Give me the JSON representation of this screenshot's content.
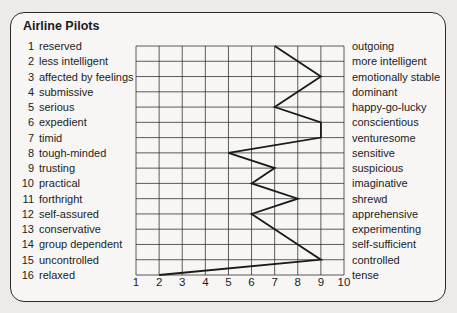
{
  "title": "Airline Pilots",
  "left_labels": [
    {
      "num": "1",
      "text": "reserved"
    },
    {
      "num": "2",
      "text": "less intelligent"
    },
    {
      "num": "3",
      "text": "affected by feelings"
    },
    {
      "num": "4",
      "text": "submissive"
    },
    {
      "num": "5",
      "text": "serious"
    },
    {
      "num": "6",
      "text": "expedient"
    },
    {
      "num": "7",
      "text": "timid"
    },
    {
      "num": "8",
      "text": "tough-minded"
    },
    {
      "num": "9",
      "text": "trusting"
    },
    {
      "num": "10",
      "text": "practical"
    },
    {
      "num": "11",
      "text": "forthright"
    },
    {
      "num": "12",
      "text": "self-assured"
    },
    {
      "num": "13",
      "text": "conservative"
    },
    {
      "num": "14",
      "text": "group dependent"
    },
    {
      "num": "15",
      "text": "uncontrolled"
    },
    {
      "num": "16",
      "text": "relaxed"
    }
  ],
  "right_labels": [
    "outgoing",
    "more intelligent",
    "emotionally stable",
    "dominant",
    "happy-go-lucky",
    "conscientious",
    "venturesome",
    "sensitive",
    "suspicious",
    "imaginative",
    "shrewd",
    "apprehensive",
    "experimenting",
    "self-sufficient",
    "controlled",
    "tense"
  ],
  "x_ticks": [
    "1",
    "2",
    "3",
    "4",
    "5",
    "6",
    "7",
    "8",
    "9",
    "10"
  ],
  "colors": {
    "line": "#1a1a1a",
    "grid": "#333333",
    "background": "#f7f6f4"
  },
  "chart_data": {
    "type": "line",
    "title": "Airline Pilots",
    "orientation": "horizontal-profile",
    "categories": [
      "1 reserved / outgoing",
      "2 less intelligent / more intelligent",
      "3 affected by feelings / emotionally stable",
      "4 submissive / dominant",
      "5 serious / happy-go-lucky",
      "6 expedient / conscientious",
      "7 timid / venturesome",
      "8 tough-minded / sensitive",
      "9 trusting / suspicious",
      "10 practical / imaginative",
      "11 forthright / shrewd",
      "12 self-assured / apprehensive",
      "13 conservative / experimenting",
      "14 group dependent / self-sufficient",
      "15 uncontrolled / controlled",
      "16 relaxed / tense"
    ],
    "series": [
      {
        "name": "Airline Pilots",
        "values": [
          7,
          8,
          9,
          8,
          7,
          9,
          9,
          5,
          7,
          6,
          8,
          6,
          7,
          8,
          9,
          2
        ]
      }
    ],
    "xlabel": "",
    "ylabel": "",
    "xlim": [
      1,
      10
    ],
    "x_ticks": [
      1,
      2,
      3,
      4,
      5,
      6,
      7,
      8,
      9,
      10
    ],
    "grid": true,
    "legend": "none"
  }
}
